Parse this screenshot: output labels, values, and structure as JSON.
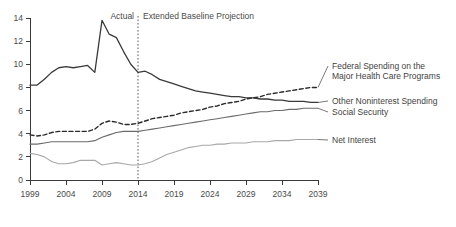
{
  "chart_data": {
    "type": "line",
    "title": "",
    "xlabel": "",
    "ylabel": "",
    "xlim": [
      1999,
      2039
    ],
    "ylim": [
      0,
      14
    ],
    "ytick_values": [
      0,
      2,
      4,
      6,
      8,
      10,
      12,
      14
    ],
    "ytick_labels": [
      "0",
      "2",
      "4",
      "6",
      "8",
      "10",
      "12",
      "14"
    ],
    "xtick_values": [
      1999,
      2004,
      2009,
      2014,
      2019,
      2024,
      2029,
      2034,
      2039
    ],
    "xtick_labels": [
      "1999",
      "2004",
      "2009",
      "2014",
      "2019",
      "2024",
      "2029",
      "2034",
      "2039"
    ],
    "grid": false,
    "legend_position": "right-inline",
    "annotations": {
      "actual_label": "Actual",
      "projection_label": "Extended Baseline Projection",
      "divider_year": 2014
    },
    "series": [
      {
        "name": "Other Noninterest Spending",
        "label": "Other Noninterest Spending",
        "style": "solid",
        "color": "#3a3a3a",
        "width": 1.3,
        "x": [
          1999,
          2000,
          2001,
          2002,
          2003,
          2004,
          2005,
          2006,
          2007,
          2008,
          2009,
          2010,
          2011,
          2012,
          2013,
          2014,
          2015,
          2016,
          2017,
          2018,
          2019,
          2020,
          2021,
          2022,
          2023,
          2024,
          2025,
          2026,
          2027,
          2028,
          2029,
          2030,
          2031,
          2032,
          2033,
          2034,
          2035,
          2036,
          2037,
          2038,
          2039
        ],
        "y": [
          8.2,
          8.2,
          8.7,
          9.3,
          9.7,
          9.8,
          9.7,
          9.8,
          9.9,
          9.3,
          13.8,
          12.6,
          12.3,
          11.1,
          10.0,
          9.3,
          9.4,
          9.1,
          8.7,
          8.5,
          8.3,
          8.1,
          7.9,
          7.7,
          7.6,
          7.5,
          7.4,
          7.3,
          7.2,
          7.2,
          7.1,
          7.1,
          7.0,
          7.0,
          6.9,
          6.9,
          6.8,
          6.8,
          6.8,
          6.7,
          6.7
        ]
      },
      {
        "name": "Federal Spending on the Major Health Care Programs",
        "label": "Federal Spending on the\nMajor Health Care Programs",
        "label_line1": "Federal Spending on the",
        "label_line2": "Major Health Care Programs",
        "style": "dashed",
        "color": "#2a2a2a",
        "width": 1.4,
        "x": [
          1999,
          2000,
          2001,
          2002,
          2003,
          2004,
          2005,
          2006,
          2007,
          2008,
          2009,
          2010,
          2011,
          2012,
          2013,
          2014,
          2015,
          2016,
          2017,
          2018,
          2019,
          2020,
          2021,
          2022,
          2023,
          2024,
          2025,
          2026,
          2027,
          2028,
          2029,
          2030,
          2031,
          2032,
          2033,
          2034,
          2035,
          2036,
          2037,
          2038,
          2039
        ],
        "y": [
          3.9,
          3.8,
          3.9,
          4.1,
          4.2,
          4.2,
          4.2,
          4.2,
          4.2,
          4.4,
          4.9,
          5.1,
          5.0,
          4.8,
          4.8,
          4.9,
          5.1,
          5.3,
          5.4,
          5.5,
          5.6,
          5.8,
          5.9,
          6.0,
          6.1,
          6.3,
          6.4,
          6.6,
          6.7,
          6.8,
          7.0,
          7.1,
          7.2,
          7.4,
          7.5,
          7.6,
          7.7,
          7.8,
          7.9,
          8.0,
          8.0
        ]
      },
      {
        "name": "Social Security",
        "label": "Social Security",
        "style": "solid",
        "color": "#6b6b6b",
        "width": 1.1,
        "x": [
          1999,
          2000,
          2001,
          2002,
          2003,
          2004,
          2005,
          2006,
          2007,
          2008,
          2009,
          2010,
          2011,
          2012,
          2013,
          2014,
          2015,
          2016,
          2017,
          2018,
          2019,
          2020,
          2021,
          2022,
          2023,
          2024,
          2025,
          2026,
          2027,
          2028,
          2029,
          2030,
          2031,
          2032,
          2033,
          2034,
          2035,
          2036,
          2037,
          2038,
          2039
        ],
        "y": [
          3.1,
          3.1,
          3.2,
          3.3,
          3.3,
          3.3,
          3.3,
          3.3,
          3.3,
          3.4,
          3.7,
          3.9,
          4.1,
          4.2,
          4.2,
          4.2,
          4.3,
          4.4,
          4.5,
          4.6,
          4.7,
          4.8,
          4.9,
          5.0,
          5.1,
          5.2,
          5.3,
          5.4,
          5.5,
          5.6,
          5.7,
          5.8,
          5.9,
          5.9,
          6.0,
          6.0,
          6.1,
          6.1,
          6.2,
          6.2,
          6.2
        ]
      },
      {
        "name": "Net Interest",
        "label": "Net Interest",
        "style": "solid",
        "color": "#a8a8a8",
        "width": 1.1,
        "x": [
          1999,
          2000,
          2001,
          2002,
          2003,
          2004,
          2005,
          2006,
          2007,
          2008,
          2009,
          2010,
          2011,
          2012,
          2013,
          2014,
          2015,
          2016,
          2017,
          2018,
          2019,
          2020,
          2021,
          2022,
          2023,
          2024,
          2025,
          2026,
          2027,
          2028,
          2029,
          2030,
          2031,
          2032,
          2033,
          2034,
          2035,
          2036,
          2037,
          2038,
          2039
        ],
        "y": [
          2.3,
          2.2,
          2.0,
          1.6,
          1.4,
          1.4,
          1.5,
          1.7,
          1.7,
          1.7,
          1.3,
          1.4,
          1.5,
          1.4,
          1.3,
          1.3,
          1.4,
          1.6,
          1.9,
          2.2,
          2.4,
          2.6,
          2.8,
          2.9,
          3.0,
          3.0,
          3.1,
          3.1,
          3.2,
          3.2,
          3.2,
          3.3,
          3.3,
          3.3,
          3.4,
          3.4,
          3.4,
          3.5,
          3.5,
          3.5,
          3.5
        ]
      }
    ]
  }
}
